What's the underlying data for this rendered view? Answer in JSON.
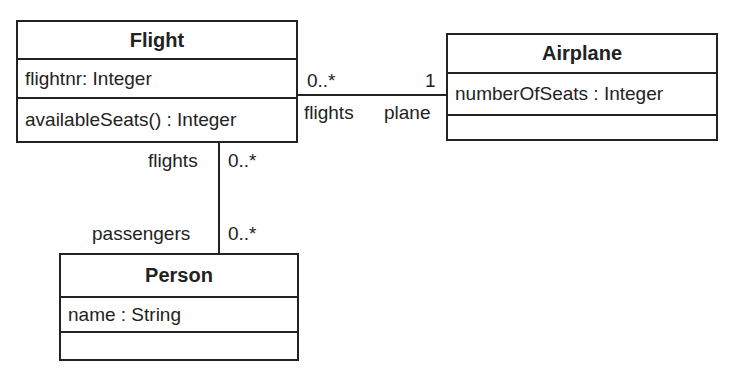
{
  "diagram": {
    "type": "UML class diagram",
    "classes": {
      "flight": {
        "name": "Flight",
        "attributes": "flightnr: Integer",
        "operations": "availableSeats() : Integer"
      },
      "airplane": {
        "name": "Airplane",
        "attributes": "numberOfSeats : Integer",
        "operations": ""
      },
      "person": {
        "name": "Person",
        "attributes": "name : String",
        "operations": ""
      }
    },
    "associations": {
      "flight_airplane": {
        "flight_end": {
          "multiplicity": "0..*",
          "role": "flights"
        },
        "airplane_end": {
          "multiplicity": "1",
          "role": "plane"
        }
      },
      "flight_person": {
        "flight_end": {
          "multiplicity": "0..*",
          "role": "flights"
        },
        "person_end": {
          "multiplicity": "0..*",
          "role": "passengers"
        }
      }
    }
  }
}
